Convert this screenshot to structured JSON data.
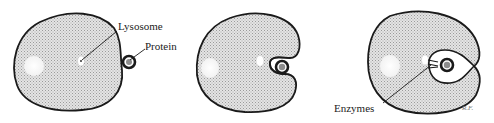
{
  "diagram": {
    "stages": [
      {
        "id": "stage-1",
        "description": "Protein particle contacts cell membrane; lysosome inside cell"
      },
      {
        "id": "stage-2",
        "description": "Cell membrane engulfs protein forming a pocket"
      },
      {
        "id": "stage-3",
        "description": "Protein enclosed in vacuole; lysosome releases enzymes"
      }
    ],
    "labels": {
      "lysosome": "Lysosome",
      "protein": "Protein",
      "enzymes": "Enzymes"
    },
    "signature": "R.F.",
    "colors": {
      "outline": "#1a1a1a",
      "cytoplasm_fill": "#d9d9d9",
      "organelle_fill": "#ffffff",
      "protein_fill": "#8c8c8c"
    }
  }
}
